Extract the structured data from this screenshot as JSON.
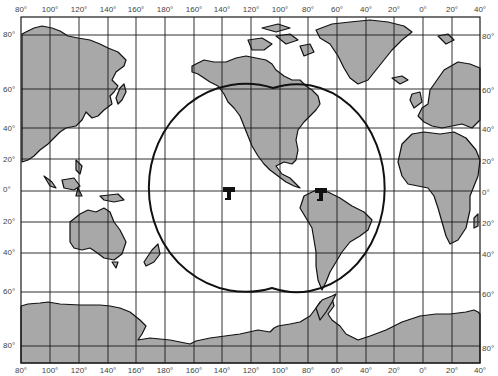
{
  "map": {
    "type": "world-map-mercator-satellite-coverage",
    "colors": {
      "land": "#a8a8a8",
      "ocean": "#ffffff",
      "grid": "#1a1a1a",
      "coverage_outline": "#111111",
      "label": "#444444"
    },
    "longitude_labels_top": [
      "80°",
      "100°",
      "120°",
      "140°",
      "160°",
      "180°",
      "160°",
      "140°",
      "120°",
      "100°",
      "80°",
      "60°",
      "40°",
      "20°",
      "0°",
      "20°",
      "40°"
    ],
    "longitude_labels_bottom": [
      "80°",
      "100°",
      "120°",
      "140°",
      "160°",
      "180°",
      "160°",
      "140°",
      "120°",
      "100°",
      "80°",
      "60°",
      "40°",
      "20°",
      "0°",
      "20°",
      "40°"
    ],
    "latitude_labels_left": [
      "80°",
      "60°",
      "40°",
      "20°",
      "0°",
      "20°",
      "40°",
      "60°",
      "80°"
    ],
    "latitude_labels_right": [
      "80°",
      "60°",
      "40°",
      "20°",
      "0°",
      "20°",
      "40°",
      "60°",
      "80°"
    ],
    "satellites": [
      {
        "name": "satellite-pacific",
        "icon": "satellite-icon",
        "longitude": "140°W",
        "latitude": "0°"
      },
      {
        "name": "satellite-south-america",
        "icon": "satellite-icon",
        "longitude": "75°W",
        "latitude": "0°"
      }
    ],
    "coverage": {
      "shape": "two overlapping circular footprints",
      "description": "Combined coverage area of two geostationary satellites"
    }
  }
}
